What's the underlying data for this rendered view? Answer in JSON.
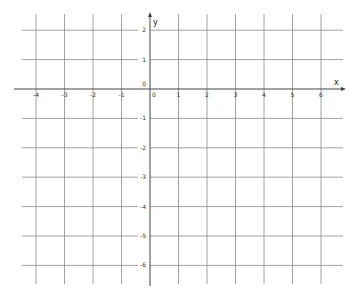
{
  "diagram": {
    "type": "coordinate-grid",
    "x_axis": {
      "label": "x",
      "ticks": [
        "-4",
        "-3",
        "-2",
        "-1",
        "0",
        "1",
        "2",
        "3",
        "4",
        "5",
        "6"
      ],
      "range": [
        -4,
        6
      ]
    },
    "y_axis": {
      "label": "y",
      "ticks": [
        "2",
        "1",
        "0",
        "-1",
        "-2",
        "-3",
        "-4",
        "-5",
        "-6"
      ],
      "range": [
        -6,
        2
      ]
    },
    "origin_label": "0",
    "grid_color": "#8a8a8a",
    "axis_color": "#444444"
  }
}
